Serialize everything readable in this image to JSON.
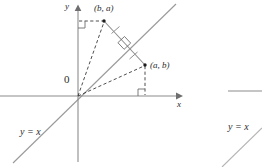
{
  "figure": {
    "background_color": "#ffffff",
    "axis_color": "#8c8c8c",
    "line_color": "#9a9a9a",
    "dash_color": "#3a3a3a",
    "text_color": "#2b2b2b",
    "axes": {
      "y_label": "y",
      "x_label": "x",
      "origin_label": "0"
    },
    "identity_line": {
      "label": "y = x"
    },
    "points": [
      {
        "id": "point-ba",
        "label": "(b, a)",
        "x": 104,
        "y": 21
      },
      {
        "id": "point-ab",
        "label": "(a, b)",
        "x": 145,
        "y": 65
      }
    ],
    "markers": {
      "right_angle_count": 3,
      "congruence_tick_count": 2
    }
  },
  "figure_partial": {
    "identity_line": {
      "label": "y = x"
    }
  }
}
